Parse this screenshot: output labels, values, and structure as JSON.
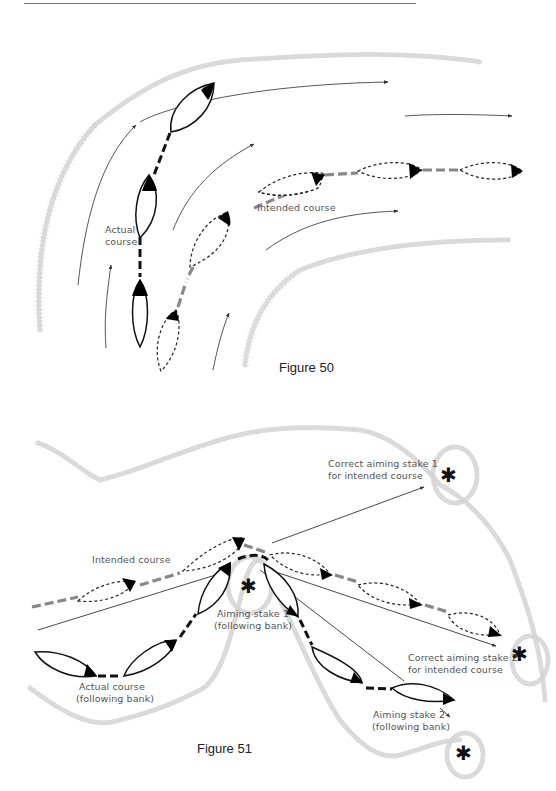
{
  "figure50": {
    "caption": "Figure 50",
    "labels": {
      "actual_line1": "Actual",
      "actual_line2": "course",
      "intended": "Intended course"
    }
  },
  "figure51": {
    "caption": "Figure 51",
    "labels": {
      "intended": "Intended course",
      "actual_line1": "Actual course",
      "actual_line2": "(following bank)",
      "aim1_line1": "Aiming stake 1",
      "aim1_line2": "(following bank)",
      "aim2_line1": "Aiming stake 2",
      "aim2_line2": "(following bank)",
      "correct1_line1": "Correct aiming stake 1",
      "correct1_line2": "for intended course",
      "correct2_line1": "Correct aiming stake 2",
      "correct2_line2": "for intended course"
    },
    "stake_symbol": "✱"
  },
  "colors": {
    "actual_path": "#111111",
    "intended_path": "#888888",
    "bank": "#d4d4d4"
  }
}
